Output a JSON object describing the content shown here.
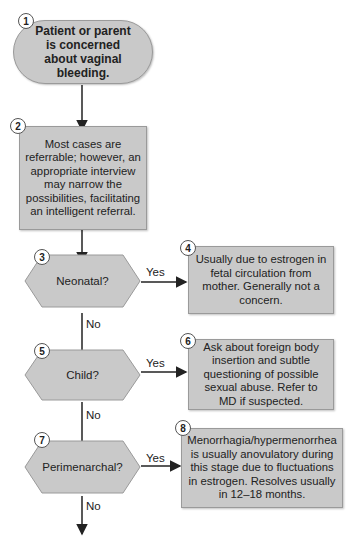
{
  "nodes": {
    "n1": {
      "num": "1",
      "text": "Patient or parent is concerned about vaginal bleeding."
    },
    "n2": {
      "num": "2",
      "text": "Most cases are referrable; however, an appropriate interview may narrow the possibilities, facilitating an intelligent referral."
    },
    "n3": {
      "num": "3",
      "text": "Neonatal?"
    },
    "n4": {
      "num": "4",
      "text": "Usually due to estrogen in fetal circulation from mother. Generally not a concern."
    },
    "n5": {
      "num": "5",
      "text": "Child?"
    },
    "n6": {
      "num": "6",
      "text": "Ask about foreign body insertion and subtle questioning of possible sexual abuse. Refer to MD if suspected."
    },
    "n7": {
      "num": "7",
      "text": "Perimenarchal?"
    },
    "n8": {
      "num": "8",
      "text": "Menorrhagia/hypermenorrhea is usually anovulatory during this stage due to fluctuations in estrogen. Resolves usually in 12–18 months."
    }
  },
  "labels": {
    "yes": "Yes",
    "no": "No"
  },
  "colors": {
    "fill": "#c9c9c9",
    "stroke": "#9a9a9a",
    "line": "#222222"
  }
}
